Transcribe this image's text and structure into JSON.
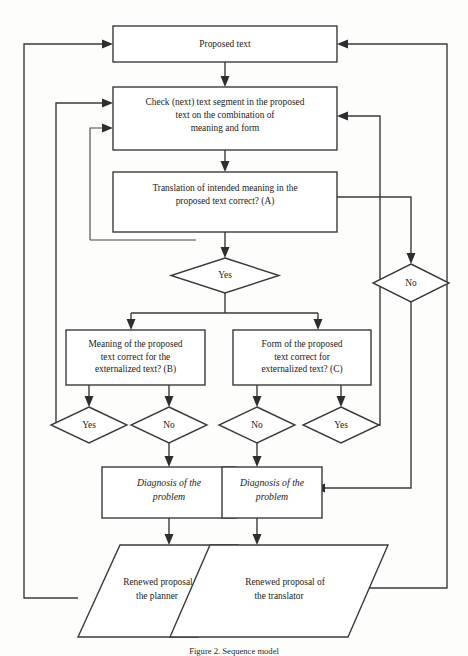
{
  "figure": {
    "caption": "Figure 2. Sequence model",
    "background_color": "#fdfdfc",
    "line_color": "#3a3a3a",
    "text_color": "#1c1c1c"
  },
  "nodes": {
    "proposed_text": {
      "shape": "rectangle",
      "lines": [
        "Proposed text"
      ]
    },
    "check_segment": {
      "shape": "rectangle",
      "lines": [
        "Check (next) text segment in the proposed",
        "text on the combination of",
        "meaning and form"
      ]
    },
    "translation_a": {
      "shape": "rectangle",
      "lines": [
        "Translation of intended meaning in the",
        "proposed text correct? (A)"
      ]
    },
    "decision_a_yes": {
      "shape": "diamond",
      "lines": [
        "Yes"
      ]
    },
    "decision_a_no": {
      "shape": "diamond",
      "lines": [
        "No"
      ]
    },
    "meaning_b": {
      "shape": "rectangle",
      "lines": [
        "Meaning of the proposed",
        "text correct for the",
        "externalized text? (B)"
      ]
    },
    "form_c": {
      "shape": "rectangle",
      "lines": [
        "Form of the proposed",
        "text correct for",
        "externalized text? (C)"
      ]
    },
    "b_yes": {
      "shape": "diamond",
      "lines": [
        "Yes"
      ]
    },
    "b_no": {
      "shape": "diamond",
      "lines": [
        "No"
      ]
    },
    "c_no": {
      "shape": "diamond",
      "lines": [
        "No"
      ]
    },
    "c_yes": {
      "shape": "diamond",
      "lines": [
        "Yes"
      ]
    },
    "diagnosis_left": {
      "shape": "rectangle",
      "style": "italic",
      "lines": [
        "Diagnosis of the",
        "problem"
      ]
    },
    "diagnosis_right": {
      "shape": "rectangle",
      "style": "italic",
      "lines": [
        "Diagnosis of the",
        "problem"
      ]
    },
    "renewal_planner": {
      "shape": "parallelogram",
      "lines": [
        "Renewed proposal of",
        "the planner"
      ]
    },
    "renewal_translator": {
      "shape": "parallelogram",
      "lines": [
        "Renewed proposal of",
        "the translator"
      ]
    }
  }
}
